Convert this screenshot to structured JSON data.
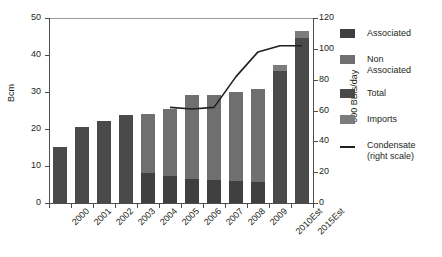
{
  "chart_data": {
    "type": "bar",
    "title": "",
    "subtitle": "",
    "xlabel": "",
    "ylabel": "Bcm",
    "y2label": "'000 BBls/day",
    "ylim": [
      0,
      50
    ],
    "y2lim": [
      0,
      120
    ],
    "yticks": [
      "0",
      "10",
      "20",
      "30",
      "40",
      "50"
    ],
    "y2ticks": [
      "0",
      "20",
      "40",
      "60",
      "80",
      "100",
      "120"
    ],
    "grid": false,
    "legend_position": "right",
    "stacked": true,
    "categories": [
      "2000",
      "2001",
      "2002",
      "2003",
      "2004",
      "2005",
      "2006",
      "2007",
      "2008",
      "2009",
      "2010Est",
      "2015Est"
    ],
    "series": [
      {
        "name": "Associated",
        "color": "#3f3f3f",
        "values": [
          0,
          0,
          0,
          0,
          8.0,
          7.2,
          6.4,
          6.2,
          6.0,
          5.6,
          0,
          0
        ]
      },
      {
        "name": "Non Associated",
        "color": "#6f6f6f",
        "values": [
          0,
          0,
          0,
          0,
          16.0,
          18.0,
          22.8,
          23.0,
          24.0,
          25.2,
          0,
          0
        ]
      },
      {
        "name": "Total",
        "color": "#4a4a4a",
        "values": [
          15.2,
          20.6,
          22.2,
          23.8,
          0,
          0,
          0,
          0,
          0,
          0,
          35.6,
          44.6
        ]
      },
      {
        "name": "Imports",
        "color": "#7c7c7c",
        "values": [
          0,
          0,
          0,
          0,
          0,
          0,
          0,
          0,
          0,
          0,
          1.6,
          2.0
        ]
      }
    ],
    "line_series": {
      "name": "Condensate (right scale)",
      "axis": "right",
      "color": "#231f20",
      "x": [
        "2005",
        "2006",
        "2007",
        "2008",
        "2009",
        "2010Est",
        "2015Est"
      ],
      "values": [
        62,
        61,
        62,
        82,
        98,
        102,
        102
      ]
    }
  },
  "axes": {
    "left_title": "Bcm",
    "right_title": "'000 BBls/day",
    "left_ticks": [
      "50",
      "40",
      "30",
      "20",
      "10",
      "0"
    ],
    "right_ticks": [
      "120",
      "100",
      "80",
      "60",
      "40",
      "20",
      "0"
    ]
  },
  "legend": {
    "items": [
      {
        "label": "Associated",
        "type": "swatch",
        "color": "#3f3f3f"
      },
      {
        "label": "Non\nAssociated",
        "line1": "Non",
        "line2": "Associated",
        "type": "swatch",
        "color": "#6f6f6f"
      },
      {
        "label": "Total",
        "type": "swatch",
        "color": "#4a4a4a"
      },
      {
        "label": "Imports",
        "type": "swatch",
        "color": "#7c7c7c"
      },
      {
        "label": "Condensate",
        "line1": "Condensate",
        "line2": "(right scale)",
        "type": "line",
        "color": "#231f20"
      }
    ]
  }
}
